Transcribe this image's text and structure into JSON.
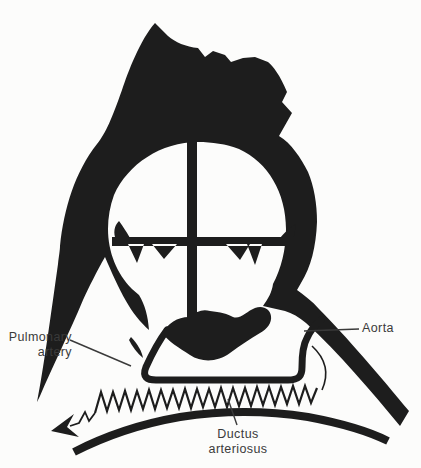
{
  "figure": {
    "ink_color": "#1d1d1d",
    "paper_color": "#fcfcfb",
    "label_color": "#3a3a3a",
    "labels": {
      "pulmonary_artery_line1": "Pulmonary",
      "pulmonary_artery_line2": "artery",
      "aorta": "Aorta",
      "ductus_line1": "Ductus",
      "ductus_line2": "arteriosus"
    }
  }
}
